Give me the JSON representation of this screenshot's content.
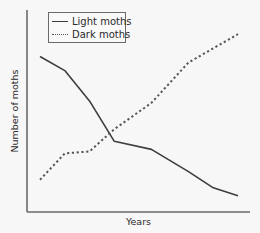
{
  "chart_data": {
    "type": "line",
    "title": "",
    "xlabel": "Years",
    "ylabel": "Number of moths",
    "x": [
      0,
      1,
      2,
      3,
      4,
      5,
      6,
      7
    ],
    "series": [
      {
        "name": "Light moths",
        "style": "solid",
        "color": "#3d3d3d",
        "x": [
          0,
          1,
          2,
          3,
          4.5,
          6,
          7,
          8
        ],
        "values": [
          77,
          70,
          55,
          35,
          31,
          20,
          12,
          8
        ]
      },
      {
        "name": "Dark moths",
        "style": "dotted",
        "color": "#555555",
        "x": [
          0,
          1,
          2,
          3,
          4.5,
          6,
          8
        ],
        "values": [
          16,
          29,
          30,
          41,
          54,
          74,
          88
        ]
      }
    ],
    "xlim": [
      -0.5,
      8.5
    ],
    "ylim": [
      0,
      100
    ],
    "xticks": [],
    "yticks": [],
    "grid": false,
    "legend_position": "upper-left"
  },
  "legend": {
    "items": [
      {
        "label": "Light moths",
        "style": "solid"
      },
      {
        "label": "Dark moths",
        "style": "dotted"
      }
    ]
  },
  "axes": {
    "x_label": "Years",
    "y_label": "Number of moths"
  }
}
